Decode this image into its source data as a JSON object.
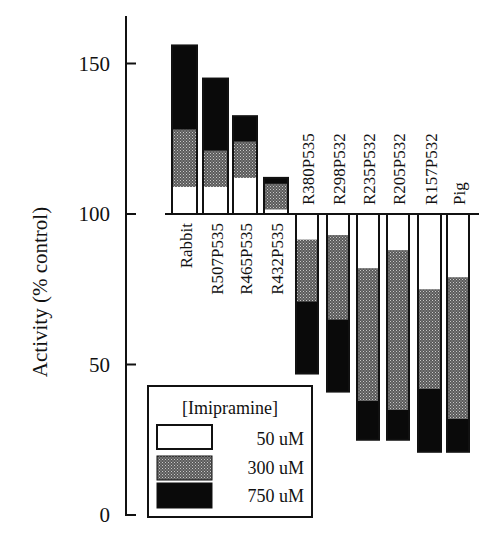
{
  "chart_data": {
    "type": "bar",
    "subtype": "stacked-deviation-from-100",
    "title": "",
    "xlabel": "",
    "ylabel": "Activity (% control)",
    "ylim": [
      0,
      160
    ],
    "yticks": [
      0,
      50,
      100,
      150
    ],
    "baseline": 100,
    "grid": false,
    "legend_title": "[Imipramine]",
    "legend_position": "lower-left",
    "categories": [
      "Rabbit",
      "R507P535",
      "R465P535",
      "R432P535",
      "R380P535",
      "R298P532",
      "R235P532",
      "R205P532",
      "R157P532",
      "Pig"
    ],
    "series": [
      {
        "name": "50 uM",
        "fill": "white",
        "values": [
          109,
          109,
          112,
          101.5,
          91.5,
          93,
          82,
          88,
          75,
          79
        ]
      },
      {
        "name": "300 uM",
        "fill": "stipple",
        "values": [
          128,
          121,
          124,
          110,
          71,
          65,
          38,
          35,
          42,
          32
        ]
      },
      {
        "name": "750 uM",
        "fill": "black",
        "values": [
          156,
          145,
          132.5,
          112,
          47,
          41,
          25,
          25,
          21,
          21
        ]
      }
    ]
  },
  "legend": {
    "title": "[Imipramine]",
    "items": [
      {
        "label": "50 uM"
      },
      {
        "label": "300 uM"
      },
      {
        "label": "750 uM"
      }
    ]
  },
  "axis": {
    "ylabel": "Activity (% control)",
    "ticks": [
      {
        "label": "150",
        "value": 150
      },
      {
        "label": "100",
        "value": 100
      },
      {
        "label": "50",
        "value": 50
      },
      {
        "label": "0",
        "value": 0
      }
    ]
  }
}
